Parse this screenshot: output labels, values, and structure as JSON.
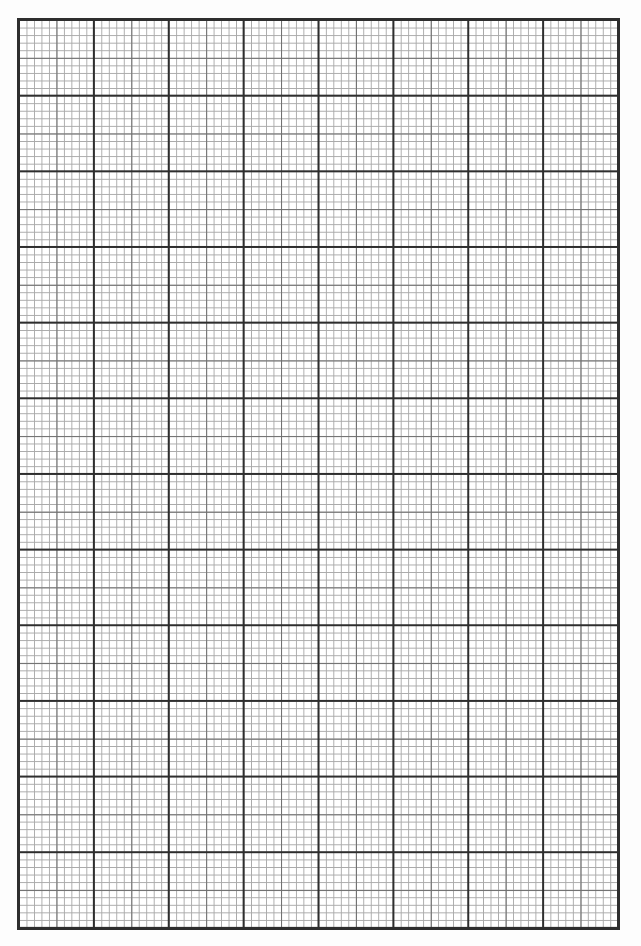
{
  "document": {
    "type": "graph-paper",
    "grid": {
      "major_columns": 8,
      "major_rows": 12,
      "minor_subdivisions_per_major": 10,
      "medium_line_every": 5,
      "colors": {
        "major_line": "#2e2e2e",
        "medium_line": "#6e6e6e",
        "minor_line": "#a9a9a9",
        "paper": "#ffffff"
      }
    }
  }
}
